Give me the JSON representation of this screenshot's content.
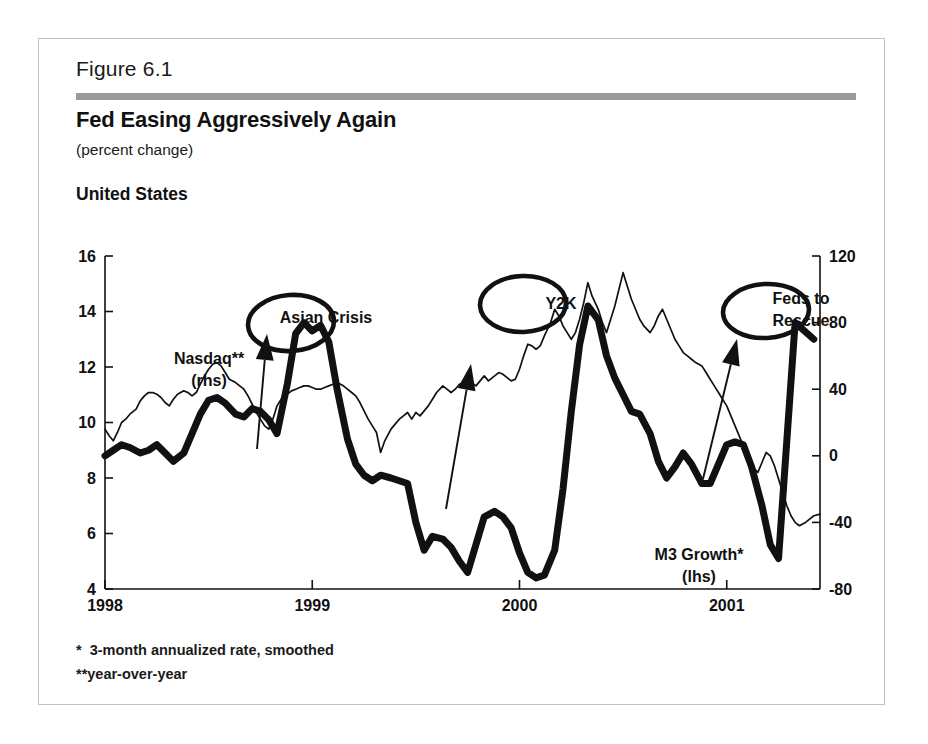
{
  "figure": {
    "number": "Figure 6.1",
    "title": "Fed Easing Aggressively Again",
    "subtitle": "(percent change)",
    "region": "United States",
    "footnote_1": "*  3-month annualized rate, smoothed",
    "footnote_2": "**year-over-year",
    "rule_color": "#9a9a9a",
    "frame_color": "#c2c2c2"
  },
  "chart_data": {
    "type": "line",
    "title": "Fed Easing Aggressively Again",
    "subtitle": "(percent change)",
    "xlabel": "",
    "ylabel": "",
    "grid": false,
    "legend_position": "inline-annotations",
    "x_ticks": [
      "1998",
      "1999",
      "2000",
      "2001"
    ],
    "x_tick_values": [
      1998,
      1999,
      2000,
      2001
    ],
    "xlim": [
      1998,
      2001.45
    ],
    "left_axis": {
      "label": "M3 Growth (lhs)",
      "ticks": [
        "4",
        "6",
        "8",
        "10",
        "12",
        "14",
        "16"
      ],
      "tick_values": [
        4,
        6,
        8,
        10,
        12,
        14,
        16
      ],
      "ylim": [
        4,
        16
      ]
    },
    "right_axis": {
      "label": "Nasdaq (rhs)",
      "ticks": [
        "-80",
        "-40",
        "0",
        "40",
        "80",
        "120"
      ],
      "tick_values": [
        -80,
        -40,
        0,
        40,
        80,
        120
      ],
      "ylim": [
        -80,
        120
      ]
    },
    "series": [
      {
        "name": "M3 Growth*",
        "axis": "left",
        "style": "thick",
        "color": "#111111",
        "x": [
          1998.0,
          1998.04,
          1998.08,
          1998.12,
          1998.17,
          1998.21,
          1998.25,
          1998.29,
          1998.33,
          1998.38,
          1998.42,
          1998.46,
          1998.5,
          1998.54,
          1998.58,
          1998.63,
          1998.67,
          1998.71,
          1998.75,
          1998.79,
          1998.83,
          1998.88,
          1998.92,
          1998.96,
          1999.0,
          1999.04,
          1999.08,
          1999.12,
          1999.17,
          1999.21,
          1999.25,
          1999.29,
          1999.33,
          1999.38,
          1999.42,
          1999.46,
          1999.5,
          1999.54,
          1999.58,
          1999.63,
          1999.67,
          1999.71,
          1999.75,
          1999.79,
          1999.83,
          1999.88,
          1999.92,
          1999.96,
          2000.0,
          2000.04,
          2000.08,
          2000.12,
          2000.17,
          2000.21,
          2000.25,
          2000.29,
          2000.33,
          2000.38,
          2000.42,
          2000.46,
          2000.5,
          2000.54,
          2000.58,
          2000.63,
          2000.67,
          2000.71,
          2000.75,
          2000.79,
          2000.83,
          2000.88,
          2000.92,
          2000.96,
          2001.0,
          2001.04,
          2001.08,
          2001.12,
          2001.17,
          2001.21,
          2001.25,
          2001.33,
          2001.42
        ],
        "y": [
          8.8,
          9.0,
          9.2,
          9.1,
          8.9,
          9.0,
          9.2,
          8.9,
          8.6,
          8.9,
          9.6,
          10.3,
          10.8,
          10.9,
          10.7,
          10.3,
          10.2,
          10.5,
          10.4,
          10.1,
          9.6,
          11.4,
          13.2,
          13.6,
          13.3,
          13.5,
          12.9,
          11.2,
          9.4,
          8.5,
          8.1,
          7.9,
          8.1,
          8.0,
          7.9,
          7.8,
          6.4,
          5.4,
          5.9,
          5.8,
          5.5,
          5.0,
          4.6,
          5.6,
          6.6,
          6.8,
          6.6,
          6.2,
          5.3,
          4.6,
          4.4,
          4.5,
          5.4,
          7.6,
          10.4,
          12.8,
          14.2,
          13.7,
          12.4,
          11.6,
          11.0,
          10.4,
          10.3,
          9.6,
          8.6,
          8.0,
          8.4,
          8.9,
          8.5,
          7.8,
          7.8,
          8.5,
          9.2,
          9.3,
          9.2,
          8.4,
          7.0,
          5.6,
          5.1,
          13.6,
          13.0
        ],
        "annotation_note": "Thick black line, left-hand scale, 3-month annualized rate, smoothed"
      },
      {
        "name": "Nasdaq**",
        "axis": "right",
        "style": "thin",
        "color": "#111111",
        "x": [
          1998.0,
          1998.02,
          1998.04,
          1998.06,
          1998.08,
          1998.1,
          1998.12,
          1998.15,
          1998.17,
          1998.19,
          1998.21,
          1998.23,
          1998.25,
          1998.27,
          1998.29,
          1998.31,
          1998.33,
          1998.35,
          1998.38,
          1998.4,
          1998.42,
          1998.44,
          1998.46,
          1998.48,
          1998.5,
          1998.52,
          1998.54,
          1998.56,
          1998.58,
          1998.6,
          1998.63,
          1998.65,
          1998.67,
          1998.69,
          1998.71,
          1998.73,
          1998.75,
          1998.77,
          1998.79,
          1998.81,
          1998.83,
          1998.85,
          1998.88,
          1998.9,
          1998.92,
          1998.94,
          1998.96,
          1998.98,
          1999.0,
          1999.02,
          1999.04,
          1999.06,
          1999.08,
          1999.1,
          1999.12,
          1999.15,
          1999.17,
          1999.19,
          1999.21,
          1999.23,
          1999.25,
          1999.27,
          1999.29,
          1999.31,
          1999.33,
          1999.35,
          1999.38,
          1999.4,
          1999.42,
          1999.44,
          1999.46,
          1999.48,
          1999.5,
          1999.52,
          1999.54,
          1999.56,
          1999.58,
          1999.6,
          1999.63,
          1999.65,
          1999.67,
          1999.69,
          1999.71,
          1999.73,
          1999.75,
          1999.77,
          1999.79,
          1999.81,
          1999.83,
          1999.85,
          1999.88,
          1999.9,
          1999.92,
          1999.94,
          1999.96,
          1999.98,
          2000.0,
          2000.02,
          2000.04,
          2000.06,
          2000.08,
          2000.1,
          2000.12,
          2000.15,
          2000.17,
          2000.19,
          2000.21,
          2000.23,
          2000.25,
          2000.27,
          2000.29,
          2000.31,
          2000.33,
          2000.35,
          2000.38,
          2000.4,
          2000.42,
          2000.44,
          2000.46,
          2000.48,
          2000.5,
          2000.52,
          2000.54,
          2000.56,
          2000.58,
          2000.6,
          2000.63,
          2000.65,
          2000.67,
          2000.69,
          2000.71,
          2000.73,
          2000.75,
          2000.77,
          2000.79,
          2000.81,
          2000.83,
          2000.85,
          2000.88,
          2000.9,
          2000.92,
          2000.94,
          2000.96,
          2000.98,
          2001.0,
          2001.02,
          2001.04,
          2001.06,
          2001.08,
          2001.1,
          2001.12,
          2001.15,
          2001.17,
          2001.19,
          2001.21,
          2001.23,
          2001.25,
          2001.27,
          2001.29,
          2001.31,
          2001.33,
          2001.35,
          2001.38,
          2001.4,
          2001.42,
          2001.45
        ],
        "y": [
          16,
          12,
          9,
          14,
          20,
          22,
          25,
          28,
          33,
          36,
          38,
          38,
          37,
          35,
          32,
          30,
          34,
          37,
          39,
          38,
          36,
          38,
          43,
          48,
          52,
          55,
          56,
          54,
          50,
          46,
          44,
          42,
          40,
          36,
          31,
          26,
          22,
          18,
          16,
          22,
          30,
          34,
          37,
          39,
          40,
          41,
          42,
          42,
          41,
          40,
          40,
          41,
          42,
          43,
          44,
          42,
          40,
          38,
          36,
          32,
          27,
          22,
          18,
          14,
          2,
          9,
          16,
          19,
          22,
          24,
          26,
          22,
          26,
          24,
          27,
          30,
          34,
          38,
          42,
          40,
          38,
          40,
          43,
          44,
          46,
          44,
          42,
          45,
          48,
          45,
          48,
          50,
          49,
          47,
          45,
          46,
          52,
          60,
          67,
          66,
          64,
          66,
          72,
          80,
          88,
          84,
          78,
          74,
          70,
          74,
          82,
          92,
          104,
          96,
          88,
          80,
          74,
          82,
          90,
          100,
          110,
          102,
          94,
          88,
          82,
          78,
          74,
          78,
          84,
          88,
          82,
          76,
          70,
          66,
          62,
          60,
          58,
          56,
          54,
          50,
          46,
          42,
          38,
          34,
          30,
          24,
          18,
          12,
          6,
          0,
          -6,
          -10,
          -4,
          2,
          0,
          -6,
          -14,
          -22,
          -30,
          -36,
          -40,
          -42,
          -40,
          -38,
          -36,
          -35
        ],
        "annotation_note": "Thin black line, right-hand scale, year-over-year"
      }
    ],
    "annotations": [
      {
        "name": "nasdaq-label",
        "text_lines": [
          "Nasdaq**",
          "(rhs)"
        ],
        "x": 170,
        "y": 325,
        "has_ellipse": false,
        "has_arrow": false
      },
      {
        "name": "asian-crisis-label",
        "text_lines": [
          "Asian Crisis"
        ],
        "x": 287,
        "y": 284,
        "has_ellipse": true,
        "has_arrow": true
      },
      {
        "name": "y2k-label",
        "text_lines": [
          "Y2K"
        ],
        "x": 522,
        "y": 270,
        "has_ellipse": true,
        "has_arrow": true
      },
      {
        "name": "feds-to-rescue-label",
        "text_lines": [
          "Feds to",
          "Rescue"
        ],
        "x": 762,
        "y": 265,
        "has_ellipse": true,
        "has_arrow": true
      },
      {
        "name": "m3-growth-label",
        "text_lines": [
          "M3 Growth*",
          "(lhs)"
        ],
        "x": 660,
        "y": 521,
        "has_ellipse": false,
        "has_arrow": false
      }
    ]
  }
}
